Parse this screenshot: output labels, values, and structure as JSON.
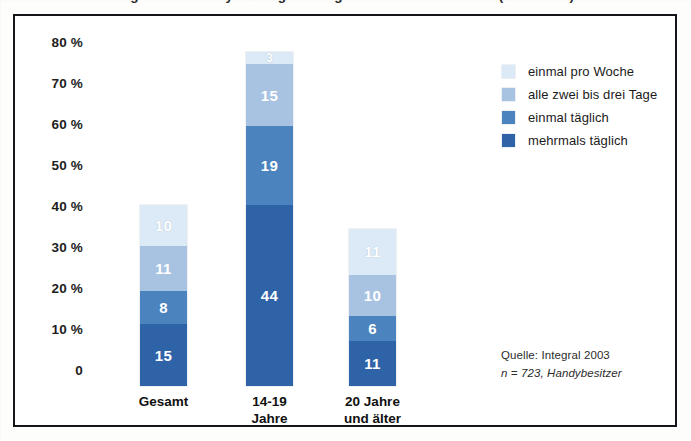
{
  "title": "Häufigkeit der Handynutzung von Jugendlichen in Österreich (in Prozent)",
  "axis": {
    "yticks": [
      "80 %",
      "70 %",
      "60 %",
      "50 %",
      "40 %",
      "30 %",
      "20 %",
      "10 %",
      "0"
    ]
  },
  "legend": {
    "items": [
      {
        "label": "einmal pro Woche",
        "color": "#dceaf7"
      },
      {
        "label": "alle zwei bis drei Tage",
        "color": "#a8c3e2"
      },
      {
        "label": "einmal täglich",
        "color": "#4a83bd"
      },
      {
        "label": "mehrmals täglich",
        "color": "#2f63a8"
      }
    ]
  },
  "source": {
    "line1": "Quelle: Integral 2003",
    "line2": "n = 723, Handybesitzer"
  },
  "bars": [
    {
      "category": "Gesamt",
      "segments": [
        {
          "series": "einmal pro Woche",
          "value": 10,
          "label": "10"
        },
        {
          "series": "alle zwei bis drei Tage",
          "value": 11,
          "label": "11"
        },
        {
          "series": "einmal täglich",
          "value": 8,
          "label": "8"
        },
        {
          "series": "mehrmals täglich",
          "value": 15,
          "label": "15"
        }
      ]
    },
    {
      "category": "14-19\nJahre",
      "segments": [
        {
          "series": "einmal pro Woche",
          "value": 3,
          "label": "3"
        },
        {
          "series": "alle zwei bis drei Tage",
          "value": 15,
          "label": "15"
        },
        {
          "series": "einmal täglich",
          "value": 19,
          "label": "19"
        },
        {
          "series": "mehrmals täglich",
          "value": 44,
          "label": "44"
        }
      ]
    },
    {
      "category": "20 Jahre\nund älter",
      "segments": [
        {
          "series": "einmal pro Woche",
          "value": 11,
          "label": "11"
        },
        {
          "series": "alle zwei bis drei Tage",
          "value": 10,
          "label": "10"
        },
        {
          "series": "einmal täglich",
          "value": 6,
          "label": "6"
        },
        {
          "series": "mehrmals täglich",
          "value": 11,
          "label": "11"
        }
      ]
    }
  ],
  "chart_data": {
    "type": "bar",
    "subtype": "stacked-bar",
    "title": "Häufigkeit der Handynutzung von Jugendlichen in Österreich (in Prozent)",
    "xlabel": "",
    "ylabel": "",
    "ylim": [
      0,
      80
    ],
    "ytick_values": [
      0,
      10,
      20,
      30,
      40,
      50,
      60,
      70,
      80
    ],
    "ytick_labels": [
      "0",
      "10 %",
      "20 %",
      "30 %",
      "40 %",
      "50 %",
      "60 %",
      "70 %",
      "80 %"
    ],
    "grid": false,
    "legend_position": "top-right",
    "categories": [
      "Gesamt",
      "14-19 Jahre",
      "20 Jahre und älter"
    ],
    "series": [
      {
        "name": "mehrmals täglich",
        "color": "#2f63a8",
        "values": [
          15,
          44,
          11
        ]
      },
      {
        "name": "einmal täglich",
        "color": "#4a83bd",
        "values": [
          8,
          19,
          6
        ]
      },
      {
        "name": "alle zwei bis drei Tage",
        "color": "#a8c3e2",
        "values": [
          11,
          15,
          10
        ]
      },
      {
        "name": "einmal pro Woche",
        "color": "#dceaf7",
        "values": [
          10,
          3,
          11
        ]
      }
    ],
    "stack_order_bottom_to_top": [
      "mehrmals täglich",
      "einmal täglich",
      "alle zwei bis drei Tage",
      "einmal pro Woche"
    ],
    "totals": [
      44,
      81,
      38
    ],
    "annotations": [
      "Quelle: Integral 2003",
      "n = 723, Handybesitzer"
    ]
  }
}
